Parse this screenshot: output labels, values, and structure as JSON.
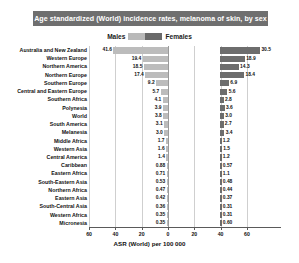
{
  "chart_title": "Age standardized (World) incidence rates, melanoma of skin, by sex",
  "legend": {
    "males_label": "Males",
    "females_label": "Females",
    "males_color": "#bcbcbc",
    "females_color": "#6d6d6d"
  },
  "axis": {
    "xlabel": "ASR (World) per 100 000",
    "ticks": [
      "60",
      "40",
      "20",
      "0",
      "20",
      "40",
      "60"
    ]
  },
  "chart_data": {
    "type": "bar",
    "orientation": "horizontal",
    "style": "diverging-population-pyramid",
    "title": "Age standardized (World) incidence rates, melanoma of skin, by sex",
    "xlabel": "ASR (World) per 100 000",
    "ylabel": "",
    "xlim": [
      -60,
      60
    ],
    "xticks": [
      -60,
      -40,
      -20,
      0,
      20,
      40,
      60
    ],
    "xtick_labels": [
      "60",
      "40",
      "20",
      "0",
      "20",
      "40",
      "60"
    ],
    "grid": true,
    "legend_position": "top-center",
    "categories": [
      "Australia and New Zealand",
      "Western Europe",
      "Northern America",
      "Northern Europe",
      "Southern Europe",
      "Central and Eastern Europe",
      "Southern Africa",
      "Polynesia",
      "World",
      "South America",
      "Melanesia",
      "Middle Africa",
      "Western Asia",
      "Central America",
      "Caribbean",
      "Eastern Africa",
      "South-Eastern Asia",
      "Northern Africa",
      "Eastern Asia",
      "South-Central Asia",
      "Western Africa",
      "Micronesia"
    ],
    "series": [
      {
        "name": "Males",
        "color": "#bcbcbc",
        "side": "left",
        "values": [
          41.6,
          19.4,
          18.5,
          17.4,
          9.2,
          5.7,
          4.1,
          3.9,
          3.8,
          3.1,
          3.0,
          1.7,
          1.6,
          1.4,
          0.88,
          0.71,
          0.53,
          0.47,
          0.42,
          0.36,
          0.35,
          0.35
        ],
        "value_labels": [
          "41.6",
          "19.4",
          "18.5",
          "17.4",
          "9.2",
          "5.7",
          "4.1",
          "3.9",
          "3.8",
          "3.1",
          "3.0",
          "1.7",
          "1.6",
          "1.4",
          "0.88",
          "0.71",
          "0.53",
          "0.47",
          "0.42",
          "0.36",
          "0.35",
          "0.35"
        ]
      },
      {
        "name": "Females",
        "color": "#6d6d6d",
        "side": "right",
        "values": [
          30.5,
          18.9,
          14.3,
          18.4,
          6.9,
          5.6,
          2.8,
          3.6,
          3.0,
          2.7,
          3.4,
          1.2,
          1.5,
          1.2,
          0.57,
          1.1,
          0.48,
          0.44,
          0.37,
          0.31,
          0.31,
          0.6
        ],
        "value_labels": [
          "30.5",
          "18.9",
          "14.3",
          "18.4",
          "6.9",
          "5.6",
          "2.8",
          "3.6",
          "3.0",
          "2.7",
          "3.4",
          "1.2",
          "1.5",
          "1.2",
          "0.57",
          "1.1",
          "0.48",
          "0.44",
          "0.37",
          "0.31",
          "0.31",
          "0.60"
        ]
      }
    ]
  }
}
